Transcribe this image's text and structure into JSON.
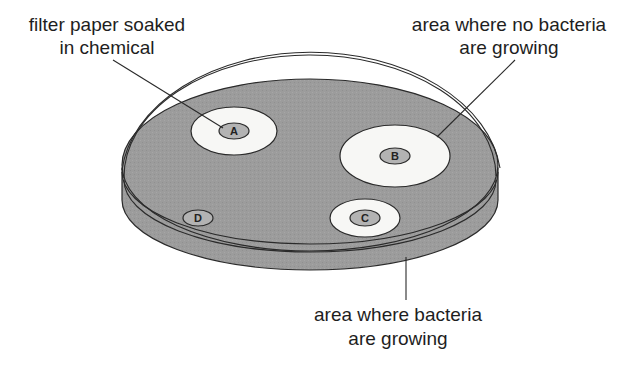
{
  "diagram": {
    "labels": {
      "filter_paper": [
        "filter paper soaked",
        "in chemical"
      ],
      "no_bacteria": [
        "area where no bacteria",
        "are growing"
      ],
      "bacteria": [
        "area where bacteria",
        "are growing"
      ]
    },
    "discs": [
      {
        "id": "A",
        "has_clear_zone": true
      },
      {
        "id": "B",
        "has_clear_zone": true
      },
      {
        "id": "C",
        "has_clear_zone": true
      },
      {
        "id": "D",
        "has_clear_zone": false
      }
    ],
    "colors": {
      "bacteria_lawn": "#9a9a9a",
      "clear_zone": "#f7f7f5",
      "disc": "#b3b3b3",
      "outline": "#2a2a2a"
    }
  }
}
